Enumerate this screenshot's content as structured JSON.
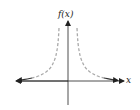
{
  "graph": {
    "y_axis_label": "f(x)",
    "x_axis_label": "x",
    "colors": {
      "axis": "#222222",
      "curve_solid": "#333333",
      "curve_dashed": "#aaaaaa"
    }
  }
}
